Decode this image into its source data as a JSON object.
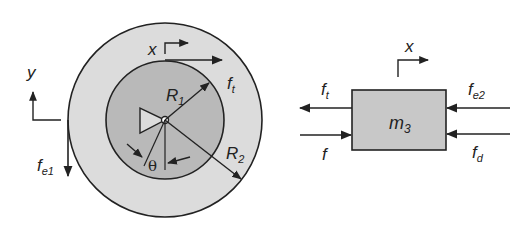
{
  "wheel": {
    "outer_radius_label": "R",
    "outer_radius_sub": "2",
    "inner_radius_label": "R",
    "inner_radius_sub": "1",
    "angle_label": "θ",
    "x_axis_label": "x",
    "y_axis_label": "y",
    "tangent_force_label": "f",
    "tangent_force_sub": "t",
    "external_force_label": "f",
    "external_force_sub": "e1",
    "colors": {
      "outer_fill": "#dcdcdc",
      "inner_fill": "#b9b9b9",
      "stroke": "#222222"
    }
  },
  "block": {
    "mass_label": "m",
    "mass_sub": "3",
    "x_axis_label": "x",
    "forces": [
      {
        "label": "f",
        "sub": "t",
        "direction": "left"
      },
      {
        "label": "f",
        "sub": "",
        "direction": "right"
      },
      {
        "label": "f",
        "sub": "e2",
        "direction": "left"
      },
      {
        "label": "f",
        "sub": "d",
        "direction": "left"
      }
    ],
    "colors": {
      "fill": "#c8c8c8",
      "stroke": "#222222"
    }
  }
}
